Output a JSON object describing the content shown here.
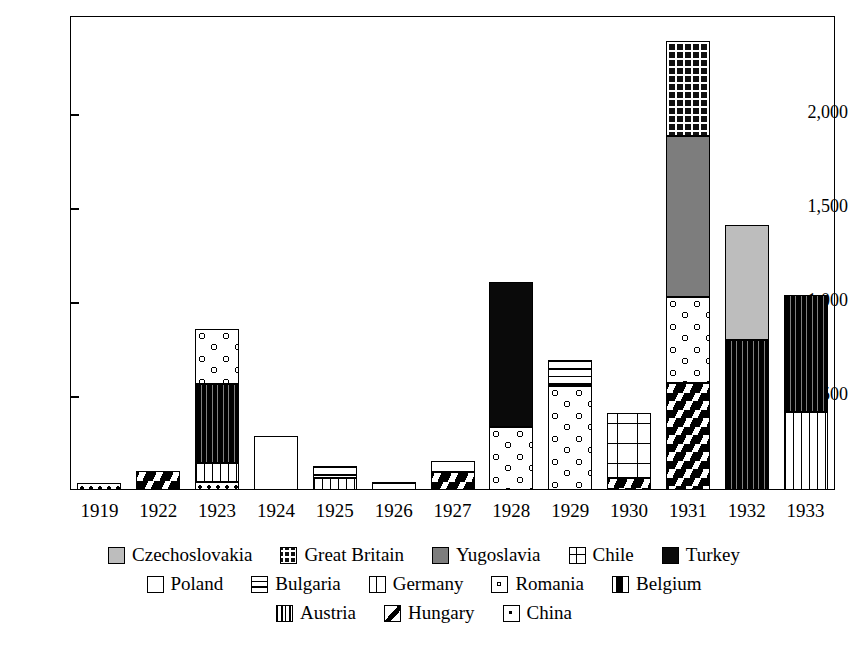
{
  "chart_data": {
    "type": "bar",
    "subtype": "stacked-bar",
    "title": "",
    "xlabel": "",
    "ylabel": "",
    "ylim": [
      0,
      2520
    ],
    "yticks": [
      500,
      1000,
      1500,
      2000
    ],
    "ytick_labels": [
      "500",
      "1,000",
      "1,500",
      "2,000"
    ],
    "grid": false,
    "legend_position": "bottom",
    "categories": [
      "1919",
      "1922",
      "1923",
      "1924",
      "1925",
      "1926",
      "1927",
      "1928",
      "1929",
      "1930",
      "1931",
      "1932",
      "1933"
    ],
    "series": [
      {
        "name": "Czechoslovakia",
        "values": [
          0,
          0,
          0,
          0,
          0,
          0,
          0,
          0,
          0,
          0,
          0,
          610,
          0
        ]
      },
      {
        "name": "Great Britain",
        "values": [
          0,
          0,
          0,
          0,
          0,
          0,
          0,
          0,
          0,
          0,
          0,
          0,
          0
        ]
      },
      {
        "name": "Yugoslavia",
        "values": [
          0,
          0,
          0,
          0,
          0,
          0,
          0,
          0,
          0,
          0,
          860,
          0,
          0
        ]
      },
      {
        "name": "Chile",
        "values": [
          0,
          0,
          0,
          0,
          0,
          0,
          0,
          0,
          0,
          345,
          0,
          0,
          0
        ]
      },
      {
        "name": "Turkey",
        "values": [
          0,
          0,
          0,
          0,
          0,
          0,
          0,
          770,
          0,
          0,
          0,
          0,
          0
        ]
      },
      {
        "name": "Poland",
        "values": [
          0,
          0,
          0,
          285,
          0,
          0,
          60,
          0,
          0,
          0,
          0,
          0,
          0
        ]
      },
      {
        "name": "Bulgaria",
        "values": [
          0,
          0,
          0,
          0,
          65,
          45,
          0,
          0,
          135,
          0,
          0,
          0,
          0
        ]
      },
      {
        "name": "Germany",
        "values": [
          0,
          0,
          105,
          0,
          65,
          0,
          0,
          0,
          0,
          0,
          0,
          0,
          415
        ]
      },
      {
        "name": "Romania",
        "values": [
          0,
          0,
          290,
          0,
          0,
          0,
          0,
          335,
          555,
          0,
          455,
          0,
          0
        ]
      },
      {
        "name": "Belgium",
        "values": [
          0,
          0,
          420,
          0,
          0,
          0,
          0,
          0,
          0,
          0,
          0,
          800,
          620
        ]
      },
      {
        "name": "Austria",
        "values": [
          0,
          0,
          0,
          0,
          0,
          0,
          0,
          0,
          0,
          0,
          505,
          0,
          0
        ]
      },
      {
        "name": "Hungary",
        "values": [
          0,
          100,
          0,
          0,
          0,
          0,
          95,
          0,
          0,
          65,
          570,
          0,
          0
        ]
      },
      {
        "name": "China",
        "values": [
          35,
          0,
          40,
          0,
          0,
          0,
          0,
          0,
          0,
          0,
          0,
          0,
          0
        ]
      }
    ],
    "totals": [
      35,
      100,
      855,
      285,
      130,
      45,
      155,
      1105,
      690,
      410,
      2390,
      1410,
      1035
    ]
  },
  "axis": {
    "y_tick_labels": [
      "2,000",
      "1,500",
      "1,000",
      "500"
    ],
    "x_tick_labels": [
      "1919",
      "1922",
      "1923",
      "1924",
      "1925",
      "1926",
      "1927",
      "1928",
      "1929",
      "1930",
      "1931",
      "1932",
      "1933"
    ]
  },
  "legend": {
    "rows": [
      [
        {
          "label": "Czechoslovakia",
          "pattern": "czechoslovakia",
          "swatch_name": "legend-swatch-czechoslovakia"
        },
        {
          "label": "Great Britain",
          "pattern": "greatbritain",
          "swatch_name": "legend-swatch-great-britain"
        },
        {
          "label": "Yugoslavia",
          "pattern": "yugoslavia",
          "swatch_name": "legend-swatch-yugoslavia"
        },
        {
          "label": "Chile",
          "pattern": "chile",
          "swatch_name": "legend-swatch-chile"
        },
        {
          "label": "Turkey",
          "pattern": "turkey",
          "swatch_name": "legend-swatch-turkey"
        }
      ],
      [
        {
          "label": "Poland",
          "pattern": "poland",
          "swatch_name": "legend-swatch-poland"
        },
        {
          "label": "Bulgaria",
          "pattern": "bulgaria",
          "swatch_name": "legend-swatch-bulgaria"
        },
        {
          "label": "Germany",
          "pattern": "germany",
          "swatch_name": "legend-swatch-germany"
        },
        {
          "label": "Romania",
          "pattern": "romania",
          "swatch_name": "legend-swatch-romania"
        },
        {
          "label": "Belgium",
          "pattern": "belgium",
          "swatch_name": "legend-swatch-belgium"
        }
      ],
      [
        {
          "label": "Austria",
          "pattern": "austria",
          "swatch_name": "legend-swatch-austria"
        },
        {
          "label": "Hungary",
          "pattern": "hungary",
          "swatch_name": "legend-swatch-hungary"
        },
        {
          "label": "China",
          "pattern": "china",
          "swatch_name": "legend-swatch-china"
        }
      ]
    ]
  },
  "colors": {
    "czechoslovakia": "#bdbdbd",
    "yugoslavia": "#7d7d7d",
    "turkey": "#0a0a0a",
    "poland": "#ffffff",
    "axis": "#000000",
    "background": "#ffffff"
  }
}
